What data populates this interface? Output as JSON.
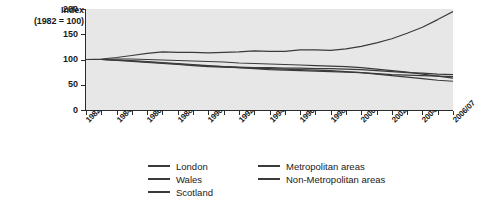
{
  "chart_data": {
    "type": "line",
    "title": "",
    "ylabel_line1": "Index",
    "ylabel_line2": "(1982 = 100)",
    "xlabel": "",
    "ylim": [
      0,
      200
    ],
    "yticks": [
      0,
      50,
      100,
      150,
      200
    ],
    "grid": false,
    "legend_position": "bottom",
    "x": [
      "1982",
      "1983",
      "1984",
      "1985/86",
      "1986/87",
      "1987/88",
      "1988/89",
      "1989/90",
      "1990/91",
      "1991/92",
      "1992/93",
      "1993/94",
      "1994/95",
      "1995/96",
      "1996/97",
      "1997/98",
      "1998/99",
      "1999/00",
      "2000/01",
      "2001/02",
      "2002/03",
      "2003/04",
      "2004/05",
      "2005/06",
      "2006/07"
    ],
    "xtick_labels": [
      "1982",
      "1984",
      "1986/87",
      "1988/89",
      "1990/91",
      "1992/93",
      "1994/95",
      "1996/97",
      "1998/99",
      "2000/01",
      "2002/03",
      "2004/05",
      "2006/07"
    ],
    "series": [
      {
        "name": "London",
        "color": "#3a3a3a",
        "values": [
          100,
          101,
          104,
          108,
          112,
          115,
          114,
          114,
          113,
          114,
          115,
          117,
          116,
          116,
          119,
          119,
          118,
          121,
          126,
          133,
          141,
          152,
          164,
          179,
          195
        ]
      },
      {
        "name": "Wales",
        "color": "#3a3a3a",
        "values": [
          100,
          100,
          99,
          98,
          96,
          94,
          92,
          90,
          88,
          86,
          84,
          82,
          80,
          79,
          78,
          77,
          76,
          75,
          74,
          72,
          70,
          69,
          68,
          67,
          66
        ]
      },
      {
        "name": "Scotland",
        "color": "#3a3a3a",
        "values": [
          100,
          100,
          98,
          96,
          94,
          92,
          90,
          88,
          86,
          85,
          84,
          83,
          82,
          81,
          80,
          79,
          78,
          76,
          74,
          71,
          68,
          65,
          62,
          59,
          57
        ]
      },
      {
        "name": "Metropolitan areas",
        "color": "#3a3a3a",
        "values": [
          100,
          100,
          101,
          101,
          100,
          99,
          98,
          97,
          96,
          95,
          93,
          92,
          91,
          90,
          89,
          88,
          87,
          86,
          84,
          81,
          78,
          75,
          71,
          67,
          63
        ]
      },
      {
        "name": "Non-Metropolitan areas",
        "color": "#3a3a3a",
        "values": [
          100,
          100,
          99,
          97,
          95,
          93,
          91,
          89,
          87,
          86,
          85,
          84,
          84,
          83,
          83,
          82,
          82,
          81,
          80,
          78,
          76,
          74,
          73,
          71,
          70
        ]
      }
    ]
  },
  "legend": {
    "column1": [
      "London",
      "Wales",
      "Scotland"
    ],
    "column2": [
      "Metropolitan areas",
      "Non-Metropolitan areas"
    ]
  },
  "caption": ""
}
